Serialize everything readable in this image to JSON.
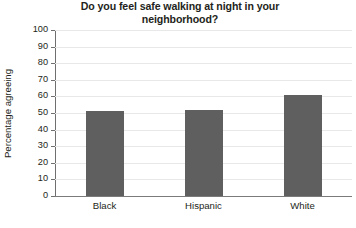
{
  "chart_data": {
    "type": "bar",
    "title": "Do you feel safe walking at night in your neighborhood?",
    "title_line1": "Do you feel safe walking at night in your",
    "title_line2": "neighborhood?",
    "xlabel": "",
    "ylabel": "Percentage agreeing",
    "categories": [
      "Black",
      "Hispanic",
      "White"
    ],
    "values": [
      51,
      52,
      61
    ],
    "ylim": [
      0,
      100
    ],
    "ytick_values": [
      0,
      10,
      20,
      30,
      40,
      50,
      60,
      70,
      80,
      90,
      100
    ],
    "ytick_labels": [
      "0",
      "10",
      "20",
      "30",
      "40",
      "50",
      "60",
      "70",
      "80",
      "90",
      "100"
    ],
    "grid": true,
    "legend": "none",
    "bar_color": "#5f5f5f",
    "gridline_color": "#e8e8e8",
    "axis_color": "#6f6f6f",
    "text_color": "#231f20",
    "background": "#ffffff"
  }
}
